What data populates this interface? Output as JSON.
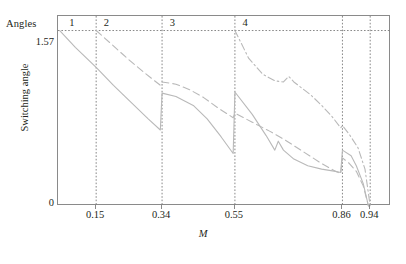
{
  "axes": {
    "angles_label": "Angles",
    "ylabel": "Switching angle",
    "xlabel": "M",
    "yticks": [
      {
        "value": 1.57,
        "label": "1.57"
      },
      {
        "value": 0,
        "label": "0"
      }
    ],
    "xticks": [
      {
        "value": 0.15,
        "label": "0.15"
      },
      {
        "value": 0.34,
        "label": "0.34"
      },
      {
        "value": 0.55,
        "label": "0.55"
      },
      {
        "value": 0.86,
        "label": "0.86"
      },
      {
        "value": 0.94,
        "label": "0.94"
      }
    ]
  },
  "regions": [
    {
      "label": "1"
    },
    {
      "label": "2"
    },
    {
      "label": "3"
    },
    {
      "label": "4"
    }
  ],
  "colors": {
    "frame": "#8a8a8a",
    "curve": "#b9b9b9",
    "grid": "#7a7a7a",
    "text": "#231f20"
  },
  "chart_data": {
    "type": "line",
    "title": "",
    "xlabel": "M",
    "ylabel": "Switching angle",
    "xlim": [
      0.04,
      1.0
    ],
    "ylim": [
      0,
      1.7
    ],
    "grid": true,
    "legend": null,
    "annotations": [
      {
        "text": "Angles",
        "position": "top-left-outside"
      },
      {
        "text": "1",
        "x": 0.075,
        "y": 1.63
      },
      {
        "text": "2",
        "x": 0.175,
        "y": 1.63
      },
      {
        "text": "3",
        "x": 0.365,
        "y": 1.63
      },
      {
        "text": "4",
        "x": 0.575,
        "y": 1.63
      }
    ],
    "gridlines": {
      "horizontal": [
        1.57
      ],
      "vertical": [
        0.15,
        0.34,
        0.55,
        0.86,
        0.94
      ]
    },
    "region_boundaries": [
      0.15,
      0.34,
      0.55,
      0.86,
      0.94
    ],
    "series": [
      {
        "name": "theta1",
        "style": "solid",
        "x": [
          0.045,
          0.09,
          0.15,
          0.2,
          0.25,
          0.3,
          0.335,
          0.34,
          0.38,
          0.43,
          0.47,
          0.51,
          0.545,
          0.55,
          0.6,
          0.64,
          0.665,
          0.675,
          0.69,
          0.72,
          0.76,
          0.8,
          0.84,
          0.855,
          0.86,
          0.885,
          0.9,
          0.92,
          0.935
        ],
        "y": [
          1.57,
          1.42,
          1.24,
          1.08,
          0.93,
          0.78,
          0.68,
          1.01,
          0.98,
          0.9,
          0.78,
          0.62,
          0.47,
          1.02,
          0.82,
          0.63,
          0.5,
          0.58,
          0.5,
          0.42,
          0.36,
          0.33,
          0.31,
          0.3,
          0.5,
          0.45,
          0.36,
          0.2,
          0.0
        ]
      },
      {
        "name": "theta2",
        "style": "dashed",
        "x": [
          0.15,
          0.19,
          0.24,
          0.29,
          0.335,
          0.34,
          0.38,
          0.42,
          0.46,
          0.5,
          0.545,
          0.55,
          0.6,
          0.65,
          0.7,
          0.75,
          0.8,
          0.84,
          0.855,
          0.86,
          0.88,
          0.9,
          0.92,
          0.935
        ],
        "y": [
          1.57,
          1.46,
          1.32,
          1.19,
          1.08,
          1.11,
          1.09,
          1.04,
          0.97,
          0.88,
          0.79,
          0.83,
          0.75,
          0.67,
          0.58,
          0.48,
          0.38,
          0.31,
          0.29,
          0.43,
          0.38,
          0.31,
          0.18,
          0.0
        ]
      },
      {
        "name": "theta3",
        "style": "dash-dot",
        "x": [
          0.55,
          0.59,
          0.63,
          0.665,
          0.69,
          0.705,
          0.72,
          0.745,
          0.77,
          0.8,
          0.83,
          0.855,
          0.86,
          0.88,
          0.905,
          0.925,
          0.94
        ],
        "y": [
          1.57,
          1.32,
          1.18,
          1.12,
          1.11,
          1.16,
          1.11,
          1.05,
          0.99,
          0.9,
          0.8,
          0.7,
          0.72,
          0.64,
          0.52,
          0.33,
          0.0
        ]
      }
    ]
  }
}
